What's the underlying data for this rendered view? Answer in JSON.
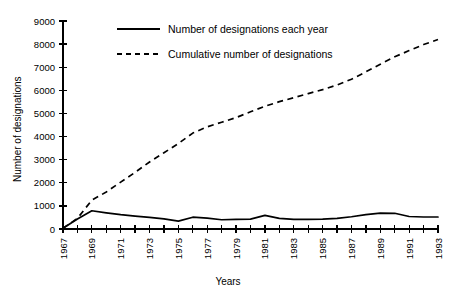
{
  "chart_data": {
    "type": "line",
    "title": "",
    "xlabel": "Years",
    "ylabel": "Number of designations",
    "ylim": [
      0,
      9000
    ],
    "xlim": [
      1967,
      1993
    ],
    "ytick_labels": [
      "0",
      "1000",
      "2000",
      "3000",
      "4000",
      "5000",
      "6000",
      "7000",
      "8000",
      "9000"
    ],
    "ytick_values": [
      0,
      1000,
      2000,
      3000,
      4000,
      5000,
      6000,
      7000,
      8000,
      9000
    ],
    "x": [
      1967,
      1968,
      1969,
      1970,
      1971,
      1972,
      1973,
      1974,
      1975,
      1976,
      1977,
      1978,
      1979,
      1980,
      1981,
      1982,
      1983,
      1984,
      1985,
      1986,
      1987,
      1988,
      1989,
      1990,
      1991,
      1992,
      1993
    ],
    "xtick_labels": [
      "1967",
      "1969",
      "1971",
      "1973",
      "1975",
      "1977",
      "1979",
      "1981",
      "1983",
      "1985",
      "1987",
      "1989",
      "1991",
      "1993"
    ],
    "xtick_values": [
      1967,
      1969,
      1971,
      1973,
      1975,
      1977,
      1979,
      1981,
      1983,
      1985,
      1987,
      1989,
      1991,
      1993
    ],
    "grid": false,
    "legend_position": "top-center",
    "series": [
      {
        "name": "Number of designations each year",
        "style": "solid",
        "values": [
          30,
          430,
          790,
          700,
          620,
          560,
          500,
          440,
          340,
          510,
          470,
          400,
          420,
          430,
          590,
          460,
          420,
          420,
          430,
          460,
          530,
          620,
          690,
          680,
          540,
          520,
          520
        ]
      },
      {
        "name": "Cumulative number of designations",
        "style": "dashed",
        "values": [
          30,
          460,
          1250,
          1600,
          2030,
          2450,
          2900,
          3300,
          3700,
          4150,
          4420,
          4620,
          4820,
          5070,
          5310,
          5510,
          5680,
          5860,
          6030,
          6230,
          6480,
          6800,
          7130,
          7450,
          7720,
          7980,
          8200
        ]
      }
    ]
  },
  "legend": {
    "items": [
      {
        "label": "Number of designations each year",
        "style": "solid"
      },
      {
        "label": "Cumulative number of designations",
        "style": "dashed"
      }
    ]
  },
  "axes": {
    "y_title": "Number of designations",
    "x_title": "Years"
  }
}
